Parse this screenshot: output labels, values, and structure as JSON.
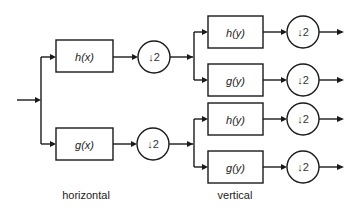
{
  "diagram": {
    "type": "block-diagram",
    "stages": {
      "horizontal": {
        "caption": "horizontal",
        "branches": [
          {
            "filter": "h(x)",
            "downsample": "↓2"
          },
          {
            "filter": "g(x)",
            "downsample": "↓2"
          }
        ]
      },
      "vertical": {
        "caption": "vertical",
        "branches": [
          {
            "filter": "h(y)",
            "downsample": "↓2"
          },
          {
            "filter": "g(y)",
            "downsample": "↓2"
          },
          {
            "filter": "h(y)",
            "downsample": "↓2"
          },
          {
            "filter": "g(y)",
            "downsample": "↓2"
          }
        ]
      }
    },
    "colors": {
      "stroke": "#1a1a1a",
      "background": "#ffffff"
    }
  }
}
